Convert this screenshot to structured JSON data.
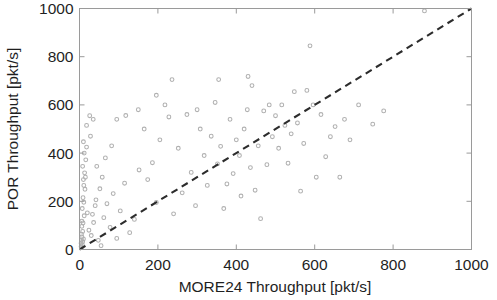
{
  "figure": {
    "kind": "scatter-plot",
    "background_color": "#ffffff",
    "marker_color": "#b0b0b0",
    "reference_line_color": "#2c2c2c",
    "axis_color": "#9a9a9a"
  },
  "chart_data": {
    "type": "scatter",
    "title": "",
    "xlabel": "MORE24 Throughput [pkt/s]",
    "ylabel": "POR Throughput [pkt/s]",
    "xlim": [
      0,
      1000
    ],
    "ylim": [
      0,
      1000
    ],
    "xticks": [
      0,
      200,
      400,
      600,
      800,
      1000
    ],
    "yticks": [
      0,
      200,
      400,
      600,
      800,
      1000
    ],
    "xticklabels": [
      "0",
      "200",
      "400",
      "600",
      "800",
      "1000"
    ],
    "yticklabels": [
      "0",
      "200",
      "400",
      "600",
      "800",
      "1000"
    ],
    "grid": false,
    "legend": null,
    "annotations": [
      {
        "kind": "reference-line",
        "label": "y = x identity line",
        "style": "dashed",
        "from": [
          0,
          0
        ],
        "to": [
          1000,
          1000
        ]
      }
    ],
    "series": [
      {
        "name": "POR vs MORE24 throughput per flow",
        "marker": "open-circle",
        "color": "#b0b0b0",
        "points": [
          [
            4,
            12
          ],
          [
            4,
            26
          ],
          [
            5,
            38
          ],
          [
            6,
            52
          ],
          [
            5,
            64
          ],
          [
            7,
            20
          ],
          [
            8,
            75
          ],
          [
            6,
            96
          ],
          [
            9,
            110
          ],
          [
            5,
            8
          ],
          [
            10,
            44
          ],
          [
            8,
            32
          ],
          [
            6,
            118
          ],
          [
            12,
            140
          ],
          [
            7,
            170
          ],
          [
            11,
            196
          ],
          [
            9,
            215
          ],
          [
            14,
            250
          ],
          [
            10,
            290
          ],
          [
            13,
            318
          ],
          [
            8,
            345
          ],
          [
            16,
            372
          ],
          [
            12,
            400
          ],
          [
            18,
            425
          ],
          [
            10,
            447
          ],
          [
            15,
            300
          ],
          [
            11,
            266
          ],
          [
            20,
            152
          ],
          [
            24,
            80
          ],
          [
            30,
            58
          ],
          [
            36,
            112
          ],
          [
            42,
            206
          ],
          [
            48,
            38
          ],
          [
            55,
            16
          ],
          [
            62,
            132
          ],
          [
            70,
            190
          ],
          [
            78,
            92
          ],
          [
            86,
            232
          ],
          [
            95,
            46
          ],
          [
            104,
            160
          ],
          [
            58,
            300
          ],
          [
            44,
            345
          ],
          [
            26,
            555
          ],
          [
            35,
            540
          ],
          [
            28,
            470
          ],
          [
            18,
            515
          ],
          [
            115,
            275
          ],
          [
            128,
            70
          ],
          [
            140,
            125
          ],
          [
            152,
            330
          ],
          [
            165,
            500
          ],
          [
            174,
            290
          ],
          [
            186,
            360
          ],
          [
            196,
            195
          ],
          [
            205,
            455
          ],
          [
            218,
            600
          ],
          [
            228,
            550
          ],
          [
            240,
            148
          ],
          [
            252,
            420
          ],
          [
            262,
            235
          ],
          [
            274,
            560
          ],
          [
            285,
            320
          ],
          [
            296,
            182
          ],
          [
            300,
            580
          ],
          [
            308,
            500
          ],
          [
            318,
            390
          ],
          [
            326,
            266
          ],
          [
            336,
            470
          ],
          [
            346,
            610
          ],
          [
            352,
            355
          ],
          [
            360,
            428
          ],
          [
            368,
            170
          ],
          [
            376,
            272
          ],
          [
            384,
            540
          ],
          [
            392,
            315
          ],
          [
            400,
            455
          ],
          [
            408,
            390
          ],
          [
            412,
            222
          ],
          [
            420,
            500
          ],
          [
            428,
            580
          ],
          [
            436,
            340
          ],
          [
            440,
            680
          ],
          [
            448,
            246
          ],
          [
            456,
            430
          ],
          [
            462,
            128
          ],
          [
            470,
            575
          ],
          [
            478,
            352
          ],
          [
            484,
            600
          ],
          [
            492,
            468
          ],
          [
            500,
            555
          ],
          [
            508,
            420
          ],
          [
            516,
            600
          ],
          [
            524,
            515
          ],
          [
            532,
            358
          ],
          [
            540,
            480
          ],
          [
            548,
            655
          ],
          [
            556,
            525
          ],
          [
            564,
            242
          ],
          [
            572,
            440
          ],
          [
            580,
            660
          ],
          [
            588,
            845
          ],
          [
            596,
            600
          ],
          [
            604,
            300
          ],
          [
            616,
            560
          ],
          [
            628,
            385
          ],
          [
            640,
            468
          ],
          [
            652,
            510
          ],
          [
            664,
            300
          ],
          [
            676,
            540
          ],
          [
            690,
            455
          ],
          [
            712,
            600
          ],
          [
            748,
            520
          ],
          [
            776,
            575
          ],
          [
            880,
            990
          ],
          [
            236,
            705
          ],
          [
            196,
            640
          ],
          [
            430,
            718
          ],
          [
            355,
            705
          ],
          [
            95,
            540
          ],
          [
            150,
            580
          ],
          [
            118,
            556
          ],
          [
            82,
            430
          ],
          [
            66,
            380
          ],
          [
            52,
            252
          ],
          [
            40,
            182
          ],
          [
            33,
            146
          ]
        ]
      }
    ]
  }
}
